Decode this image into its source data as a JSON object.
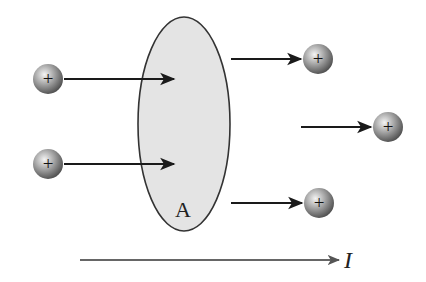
{
  "diagram": {
    "area_label": "A",
    "current_label": "I",
    "charge_symbol": "+",
    "colors": {
      "area_fill": "#e4e4e4",
      "area_stroke": "#333333",
      "arrow": "#1a1a1a",
      "current_arrow": "#666666",
      "charge_light": "#f2f2f2",
      "charge_dark": "#555555"
    },
    "charges": [
      {
        "id": "left-top",
        "cx": 48,
        "cy": 79
      },
      {
        "id": "left-bottom",
        "cx": 48,
        "cy": 164
      },
      {
        "id": "right-top",
        "cx": 318,
        "cy": 59
      },
      {
        "id": "right-middle",
        "cx": 388,
        "cy": 127
      },
      {
        "id": "right-bottom",
        "cx": 319,
        "cy": 203
      }
    ],
    "arrows": [
      {
        "id": "left-top-arrow",
        "x1": 64,
        "x2": 174,
        "y": 79
      },
      {
        "id": "left-bottom-arrow",
        "x1": 64,
        "x2": 174,
        "y": 164
      },
      {
        "id": "right-top-arrow",
        "x1": 231,
        "x2": 301,
        "y": 59
      },
      {
        "id": "right-middle-arrow",
        "x1": 301,
        "x2": 371,
        "y": 127
      },
      {
        "id": "right-bottom-arrow",
        "x1": 231,
        "x2": 302,
        "y": 203
      }
    ]
  }
}
